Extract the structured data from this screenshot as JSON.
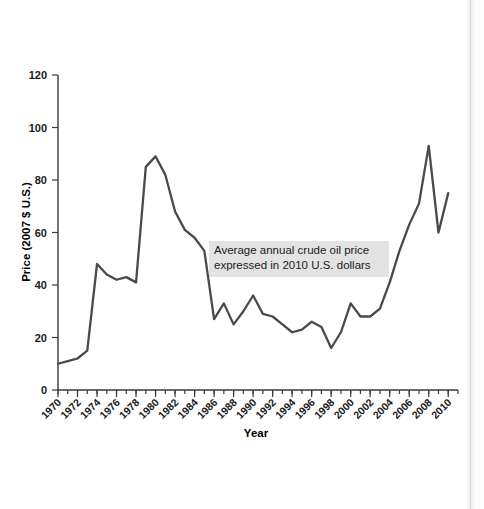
{
  "chart_data": {
    "type": "line",
    "title": "",
    "xlabel": "Year",
    "ylabel": "Price (2007 $ U.S.)",
    "xlim": [
      1970,
      2011
    ],
    "ylim": [
      0,
      120
    ],
    "grid": false,
    "legend": "none",
    "line_color": "#4a4a4a",
    "annotation": {
      "line1": "Average annual crude oil price",
      "line2": "expressed in 2010 U.S. dollars",
      "background_color": "#e3e3e3"
    },
    "ytick_labels": [
      "0",
      "20",
      "40",
      "60",
      "80",
      "100",
      "120"
    ],
    "ytick_values": [
      0,
      20,
      40,
      60,
      80,
      100,
      120
    ],
    "xtick_labels": [
      "1970",
      "1972",
      "1974",
      "1976",
      "1978",
      "1980",
      "1982",
      "1984",
      "1986",
      "1988",
      "1990",
      "1992",
      "1994",
      "1996",
      "1998",
      "2000",
      "2002",
      "2004",
      "2006",
      "2008",
      "2010"
    ],
    "xtick_values": [
      1970,
      1972,
      1974,
      1976,
      1978,
      1980,
      1982,
      1984,
      1986,
      1988,
      1990,
      1992,
      1994,
      1996,
      1998,
      2000,
      2002,
      2004,
      2006,
      2008,
      2010
    ],
    "x": [
      1970,
      1971,
      1972,
      1973,
      1974,
      1975,
      1976,
      1977,
      1978,
      1979,
      1980,
      1981,
      1982,
      1983,
      1984,
      1985,
      1986,
      1987,
      1988,
      1989,
      1990,
      1991,
      1992,
      1993,
      1994,
      1995,
      1996,
      1997,
      1998,
      1999,
      2000,
      2001,
      2002,
      2003,
      2004,
      2005,
      2006,
      2007,
      2008,
      2009,
      2010
    ],
    "values": [
      10,
      11,
      12,
      15,
      48,
      44,
      42,
      43,
      41,
      85,
      89,
      82,
      68,
      61,
      58,
      53,
      27,
      33,
      25,
      30,
      36,
      29,
      28,
      25,
      22,
      23,
      26,
      24,
      16,
      22,
      33,
      28,
      28,
      31,
      41,
      53,
      63,
      71,
      93,
      60,
      75
    ]
  },
  "axis": {
    "ylabel": "Price (2007 $ U.S.)",
    "xlabel": "Year"
  }
}
